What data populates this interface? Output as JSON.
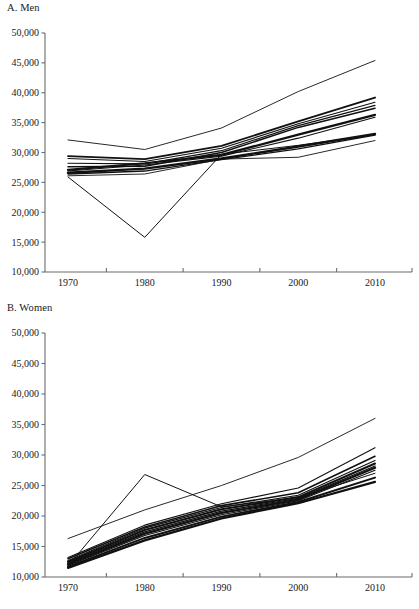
{
  "figure": {
    "background": "#ffffff",
    "line_color": "#111111",
    "axis_color": "#6b6b6b"
  },
  "chart_data": [
    {
      "type": "line",
      "title": "A. Men",
      "panel_label": "A. Men",
      "xlabel": "",
      "ylabel": "",
      "x": [
        1970,
        1980,
        1990,
        2000,
        2010
      ],
      "xtick_labels": [
        "1970",
        "1980",
        "1990",
        "2000",
        "2010"
      ],
      "ytick_labels": [
        "10,000",
        "15,000",
        "20,000",
        "25,000",
        "30,000",
        "35,000",
        "40,000",
        "45,000",
        "50,000"
      ],
      "yticks": [
        10000,
        15000,
        20000,
        25000,
        30000,
        35000,
        40000,
        45000,
        50000
      ],
      "ylim": [
        10000,
        50000
      ],
      "xlim": [
        1965,
        2014
      ],
      "grid": false,
      "legend": "none",
      "series": [
        {
          "name": "series-1",
          "values": [
            32100,
            30500,
            34100,
            40200,
            45400
          ],
          "width": 0.9
        },
        {
          "name": "series-2",
          "values": [
            29400,
            28900,
            31100,
            35200,
            39200
          ],
          "width": 1.8
        },
        {
          "name": "series-3",
          "values": [
            29000,
            28500,
            30700,
            34800,
            38400
          ],
          "width": 1.1
        },
        {
          "name": "series-4",
          "values": [
            28200,
            28100,
            30300,
            34500,
            37900
          ],
          "width": 1.2
        },
        {
          "name": "series-5",
          "values": [
            27600,
            27700,
            30000,
            34200,
            37400
          ],
          "width": 1.5
        },
        {
          "name": "series-6",
          "values": [
            27100,
            28200,
            29600,
            33000,
            36300
          ],
          "width": 2.2
        },
        {
          "name": "series-7",
          "values": [
            26900,
            27900,
            29400,
            32400,
            35900
          ],
          "width": 1.1
        },
        {
          "name": "series-8",
          "values": [
            26600,
            27300,
            29000,
            31000,
            33100
          ],
          "width": 2.4
        },
        {
          "name": "series-9",
          "values": [
            26400,
            26900,
            28800,
            30600,
            32900
          ],
          "width": 1.3
        },
        {
          "name": "series-10",
          "values": [
            26100,
            26400,
            28900,
            29200,
            32000
          ],
          "width": 0.9
        },
        {
          "name": "series-11-outlier",
          "values": [
            25900,
            15800,
            29700,
            31200,
            33000
          ],
          "width": 1.0
        }
      ]
    },
    {
      "type": "line",
      "title": "B. Women",
      "panel_label": "B. Women",
      "xlabel": "",
      "ylabel": "",
      "x": [
        1970,
        1980,
        1990,
        2000,
        2010
      ],
      "xtick_labels": [
        "1970",
        "1980",
        "1990",
        "2000",
        "2010"
      ],
      "ytick_labels": [
        "10,000",
        "15,000",
        "20,000",
        "25,000",
        "30,000",
        "35,000",
        "40,000",
        "45,000",
        "50,000"
      ],
      "yticks": [
        10000,
        15000,
        20000,
        25000,
        30000,
        35000,
        40000,
        45000,
        50000
      ],
      "ylim": [
        10000,
        50000
      ],
      "xlim": [
        1965,
        2014
      ],
      "grid": false,
      "legend": "none",
      "series": [
        {
          "name": "series-1",
          "values": [
            16300,
            21000,
            25000,
            29600,
            36000
          ],
          "width": 0.9
        },
        {
          "name": "series-2",
          "values": [
            13200,
            18500,
            22000,
            24600,
            31200
          ],
          "width": 1.1
        },
        {
          "name": "series-3",
          "values": [
            13000,
            18200,
            21700,
            23800,
            29800
          ],
          "width": 1.6
        },
        {
          "name": "series-4",
          "values": [
            12700,
            18000,
            21400,
            23400,
            29100
          ],
          "width": 1.2
        },
        {
          "name": "series-5",
          "values": [
            12500,
            17700,
            21100,
            23100,
            28600
          ],
          "width": 2.0
        },
        {
          "name": "series-6",
          "values": [
            12300,
            17400,
            20800,
            22900,
            28200
          ],
          "width": 1.3
        },
        {
          "name": "series-7",
          "values": [
            12100,
            17100,
            20500,
            22700,
            27900
          ],
          "width": 2.3
        },
        {
          "name": "series-8",
          "values": [
            11900,
            16800,
            20200,
            22500,
            27500
          ],
          "width": 1.2
        },
        {
          "name": "series-9",
          "values": [
            11700,
            16400,
            19900,
            22300,
            26300
          ],
          "width": 1.9
        },
        {
          "name": "series-10",
          "values": [
            11500,
            16000,
            19600,
            22100,
            25600
          ],
          "width": 2.2
        },
        {
          "name": "series-11-outlier",
          "values": [
            11800,
            26800,
            21500,
            23000,
            27000
          ],
          "width": 1.0
        }
      ]
    }
  ]
}
